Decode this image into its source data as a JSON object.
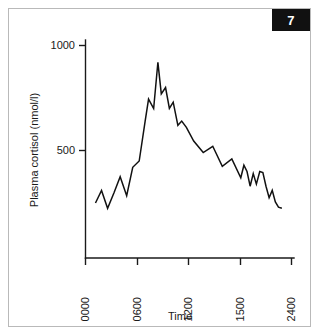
{
  "figure": {
    "badge_number": "7",
    "background_color": "#ffffff",
    "border_color": "#b9b9b9",
    "ink_color": "#111111"
  },
  "chart_data": {
    "type": "line",
    "title": "",
    "subtitle": "",
    "xlabel": "Time",
    "ylabel": "Plasma cortisol (nmol/l)",
    "x_tick_labels": [
      "0000",
      "0600",
      "1200",
      "1500",
      "2400"
    ],
    "x_tick_values": [
      0,
      600,
      1200,
      1500,
      2400
    ],
    "y_tick_labels": [
      "500",
      "1000"
    ],
    "y_tick_values": [
      500,
      1000
    ],
    "ylim": [
      0,
      1100
    ],
    "xlim": [
      0,
      2400
    ],
    "grid": false,
    "legend": "none",
    "series": [
      {
        "name": "Plasma cortisol",
        "x": [
          115,
          185,
          255,
          330,
          400,
          475,
          545,
          620,
          690,
          730,
          790,
          840,
          880,
          930,
          975,
          1020,
          1075,
          1120,
          1175,
          1230,
          1285,
          1340,
          1395,
          1450,
          1505,
          1560,
          1615,
          1670,
          1725,
          1780,
          1840,
          1895,
          1950,
          2005,
          2060,
          2115,
          2170,
          2230
        ],
        "y": [
          250,
          310,
          225,
          300,
          375,
          285,
          420,
          450,
          640,
          745,
          700,
          920,
          770,
          800,
          700,
          730,
          620,
          640,
          610,
          545,
          490,
          520,
          425,
          460,
          370,
          430,
          400,
          330,
          390,
          340,
          400,
          395,
          330,
          275,
          310,
          255,
          230,
          225
        ],
        "color": "#111111"
      }
    ]
  }
}
